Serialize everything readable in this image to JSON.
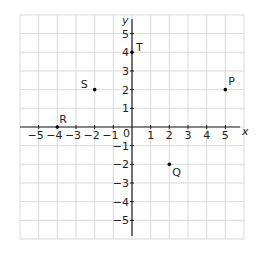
{
  "diagram": {
    "type": "coordinate-grid",
    "axes": {
      "x_label": "x",
      "y_label": "y",
      "origin_label": "0",
      "x_ticks": [
        "−5",
        "−4",
        "−3",
        "−2",
        "−1",
        "1",
        "2",
        "3",
        "4",
        "5"
      ],
      "x_tick_values": [
        -5,
        -4,
        -3,
        -2,
        -1,
        1,
        2,
        3,
        4,
        5
      ],
      "y_ticks": [
        "5",
        "4",
        "3",
        "2",
        "1",
        "−1",
        "−2",
        "−3",
        "−4",
        "−5"
      ],
      "y_tick_values": [
        5,
        4,
        3,
        2,
        1,
        -1,
        -2,
        -3,
        -4,
        -5
      ],
      "range": {
        "x": [
          -6,
          6
        ],
        "y": [
          -6,
          6
        ]
      }
    },
    "points": [
      {
        "label": "P",
        "x": 5,
        "y": 2
      },
      {
        "label": "Q",
        "x": 2,
        "y": -2
      },
      {
        "label": "R",
        "x": -4,
        "y": 0
      },
      {
        "label": "S",
        "x": -2,
        "y": 2
      },
      {
        "label": "T",
        "x": 0,
        "y": 4
      }
    ],
    "colors": {
      "grid": "#d9d9d9",
      "axis": "#231f20",
      "point": "#000000",
      "text": "#231f20"
    }
  }
}
